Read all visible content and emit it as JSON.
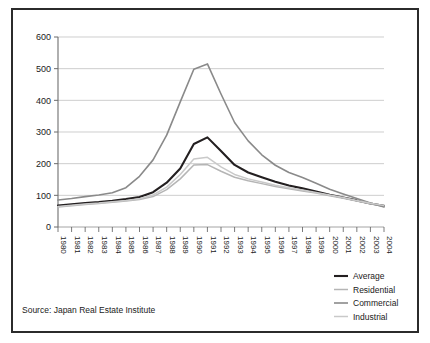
{
  "figure": {
    "source_note": "Source: Japan Real Estate Institute",
    "border_color": "#2b2b2b",
    "background_color": "#ffffff"
  },
  "chart_data": {
    "type": "line",
    "title": "",
    "subtitle": "",
    "xlabel": "",
    "ylabel": "",
    "grid": true,
    "grid_axis": "y",
    "legend_position": "bottom-right",
    "xlim": [
      1980,
      2004
    ],
    "ylim": [
      0,
      600
    ],
    "ytick_values": [
      0,
      100,
      200,
      300,
      400,
      500,
      600
    ],
    "ytick_labels": [
      "0",
      "100",
      "200",
      "300",
      "400",
      "500",
      "600"
    ],
    "x": [
      1980,
      1981,
      1982,
      1983,
      1984,
      1985,
      1986,
      1987,
      1988,
      1989,
      1990,
      1991,
      1992,
      1993,
      1994,
      1995,
      1996,
      1997,
      1998,
      1999,
      2000,
      2001,
      2002,
      2003,
      2004
    ],
    "xtick_labels": [
      "1980",
      "1981",
      "1982",
      "1983",
      "1984",
      "1985",
      "1986",
      "1987",
      "1988",
      "1989",
      "1990",
      "1991",
      "1992",
      "1993",
      "1994",
      "1995",
      "1996",
      "1997",
      "1998",
      "1999",
      "2000",
      "2001",
      "2002",
      "2003",
      "2004"
    ],
    "xtick_rotation": 90,
    "series": [
      {
        "name": "Average",
        "color": "#231f20",
        "width": 2.1,
        "values": [
          68,
          72,
          76,
          79,
          83,
          88,
          95,
          110,
          140,
          185,
          262,
          283,
          240,
          196,
          172,
          157,
          143,
          131,
          122,
          112,
          102,
          93,
          84,
          74,
          67
        ]
      },
      {
        "name": "Residential",
        "color": "#b5b5b5",
        "width": 1.5,
        "values": [
          63,
          67,
          71,
          74,
          78,
          82,
          87,
          96,
          118,
          152,
          196,
          197,
          176,
          157,
          146,
          137,
          128,
          121,
          114,
          107,
          99,
          91,
          82,
          73,
          65
        ]
      },
      {
        "name": "Commercial",
        "color": "#8a8a8a",
        "width": 1.6,
        "values": [
          85,
          90,
          96,
          101,
          108,
          124,
          160,
          212,
          290,
          395,
          498,
          515,
          420,
          330,
          272,
          228,
          195,
          172,
          156,
          138,
          119,
          104,
          90,
          76,
          63
        ]
      },
      {
        "name": "Industrial",
        "color": "#c9c9c9",
        "width": 1.5,
        "values": [
          65,
          69,
          73,
          76,
          80,
          84,
          89,
          101,
          126,
          166,
          215,
          220,
          190,
          166,
          152,
          142,
          132,
          124,
          117,
          109,
          101,
          93,
          84,
          75,
          68
        ]
      }
    ]
  },
  "legend": {
    "items": [
      {
        "label": "Average"
      },
      {
        "label": "Residential"
      },
      {
        "label": "Commercial"
      },
      {
        "label": "Industrial"
      }
    ]
  }
}
